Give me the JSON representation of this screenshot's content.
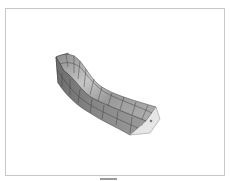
{
  "figure": {
    "colors": {
      "frame_border": "#c8c8c8",
      "surface_dark": "#7a7a7a",
      "surface_mid": "#9c9c9c",
      "surface_light": "#c4c4c4",
      "end_face": "#e6e6e6",
      "mesh_line": "#3a3a3a",
      "bottom_bar": "#9a9a9a"
    }
  }
}
